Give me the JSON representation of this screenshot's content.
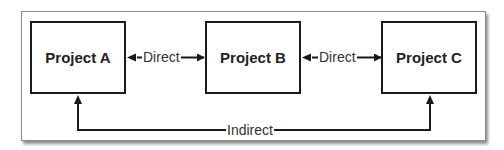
{
  "diagram": {
    "nodes": [
      {
        "id": "A",
        "label": "Project A"
      },
      {
        "id": "B",
        "label": "Project B"
      },
      {
        "id": "C",
        "label": "Project C"
      }
    ],
    "edges": [
      {
        "from": "A",
        "to": "B",
        "label": "Direct",
        "bidirectional": true
      },
      {
        "from": "B",
        "to": "C",
        "label": "Direct",
        "bidirectional": true
      },
      {
        "from": "A",
        "to": "C",
        "label": "Indirect",
        "bidirectional": true
      }
    ]
  },
  "colors": {
    "line": "#1a1a1a",
    "frame": "#8a8a8a",
    "text": "#222222"
  }
}
